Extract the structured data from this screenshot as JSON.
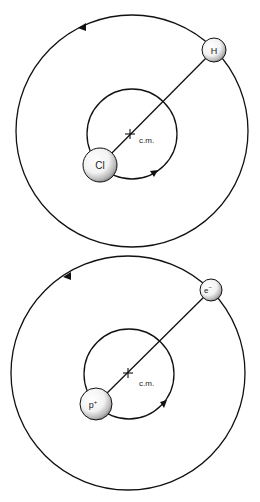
{
  "diagrams": [
    {
      "id": "hcl",
      "outer_orbit": {
        "cx": 132,
        "cy": 131,
        "r": 116,
        "arrow_direction": "counterclockwise"
      },
      "inner_orbit": {
        "cx": 132,
        "cy": 134,
        "r": 45,
        "arrow_direction": "counterclockwise"
      },
      "center_of_mass": {
        "x": 130,
        "y": 134,
        "label": "c.m."
      },
      "heavy_particle": {
        "label": "Cl",
        "x": 100,
        "y": 165,
        "r": 17
      },
      "light_particle": {
        "label": "H",
        "x": 214,
        "y": 50,
        "r": 12
      }
    },
    {
      "id": "hydrogen",
      "outer_orbit": {
        "cx": 128,
        "cy": 373,
        "r": 117,
        "arrow_direction": "counterclockwise"
      },
      "inner_orbit": {
        "cx": 129,
        "cy": 374,
        "r": 45,
        "arrow_direction": "counterclockwise"
      },
      "center_of_mass": {
        "x": 128,
        "y": 373,
        "label": "c.m."
      },
      "heavy_particle": {
        "label": "p+",
        "x": 96,
        "y": 404,
        "r": 16
      },
      "light_particle": {
        "label": "e−",
        "x": 211,
        "y": 290,
        "r": 11
      }
    }
  ],
  "labels": {
    "top_cm": "c.m.",
    "top_heavy": "Cl",
    "top_light": "H",
    "bottom_cm": "c.m.",
    "bottom_heavy_base": "p",
    "bottom_heavy_sup": "+",
    "bottom_light_base": "e",
    "bottom_light_sup": "−"
  },
  "colors": {
    "line": "#111111",
    "sphere_light": "#ffffff",
    "sphere_shade": "#8a8a8a"
  }
}
